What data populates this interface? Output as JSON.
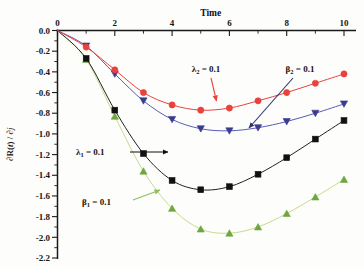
{
  "chart_data": {
    "type": "line",
    "title": "",
    "xlabel": "Time",
    "ylabel": "∂R(t) / ∂j",
    "xlim": [
      0,
      10
    ],
    "ylim": [
      -2.2,
      0.0
    ],
    "x_axis_position": "top",
    "grid": false,
    "legend": "annotations",
    "xticks": [
      0,
      2,
      4,
      6,
      8,
      10
    ],
    "xticklabels": [
      "0",
      "2",
      "4",
      "6",
      "8",
      "10"
    ],
    "xminorticks": [
      1,
      3,
      5,
      7,
      9
    ],
    "yticks": [
      0.0,
      -0.2,
      -0.4,
      -0.6,
      -0.8,
      -1.0,
      -1.2,
      -1.4,
      -1.6,
      -1.8,
      -2.0,
      -2.2
    ],
    "yticklabels": [
      "0.0",
      "-0.2",
      "-0.4",
      "-0.6",
      "-0.8",
      "-1.0",
      "-1.2",
      "-1.4",
      "-1.6",
      "-1.8",
      "-2.0",
      "-2.2"
    ],
    "x": [
      0,
      1,
      2,
      3,
      4,
      5,
      6,
      7,
      8,
      9,
      10
    ],
    "series": [
      {
        "name": "λ₂ = 0.1",
        "marker": "circle",
        "color": "#E8423C",
        "line_color": "#E8423C",
        "values": [
          0.0,
          -0.16,
          -0.38,
          -0.6,
          -0.72,
          -0.77,
          -0.75,
          -0.68,
          -0.6,
          -0.51,
          -0.42
        ]
      },
      {
        "name": "β₂ = 0.1",
        "marker": "triangle-down",
        "color": "#3B3C8C",
        "line_color": "#5A5BB8",
        "values": [
          0.0,
          -0.15,
          -0.42,
          -0.68,
          -0.86,
          -0.95,
          -0.97,
          -0.94,
          -0.88,
          -0.8,
          -0.71
        ]
      },
      {
        "name": "λ₁ = 0.1",
        "marker": "square",
        "color": "#111111",
        "line_color": "#222222",
        "values": [
          0.0,
          -0.27,
          -0.77,
          -1.19,
          -1.45,
          -1.54,
          -1.51,
          -1.39,
          -1.23,
          -1.05,
          -0.87
        ]
      },
      {
        "name": "β₁ = 0.1",
        "marker": "triangle-up",
        "color": "#6EA83C",
        "line_color": "#C4DC8C",
        "values": [
          0.0,
          -0.28,
          -0.83,
          -1.36,
          -1.72,
          -1.92,
          -1.96,
          -1.9,
          -1.77,
          -1.61,
          -1.44
        ]
      }
    ],
    "annotations": [
      {
        "id": "lambda2",
        "text_main": "λ",
        "text_sub": "2",
        "text_tail": " = 0.1",
        "full": "λ₂ = 0.1",
        "target_series": "λ₂ = 0.1",
        "color": "#E8423C"
      },
      {
        "id": "beta2",
        "text_main": "β",
        "text_sub": "2",
        "text_tail": " = 0.1",
        "full": "β₂ = 0.1",
        "target_series": "β₂ = 0.1",
        "color": "#2F3070"
      },
      {
        "id": "lambda1",
        "text_main": "λ",
        "text_sub": "1",
        "text_tail": " = 0.1",
        "full": "λ₁ = 0.1",
        "target_series": "λ₁ = 0.1",
        "color": "#111111"
      },
      {
        "id": "beta1",
        "text_main": "β",
        "text_sub": "1",
        "text_tail": " = 0.1",
        "full": "β₁ = 0.1",
        "target_series": "β₁ = 0.1",
        "color": "#8FBF5A"
      }
    ]
  },
  "ylabel_parts": {
    "d1": "∂",
    "r": "R(",
    "t": "t",
    "close": ") / ",
    "d2": "∂",
    "j": "j"
  }
}
